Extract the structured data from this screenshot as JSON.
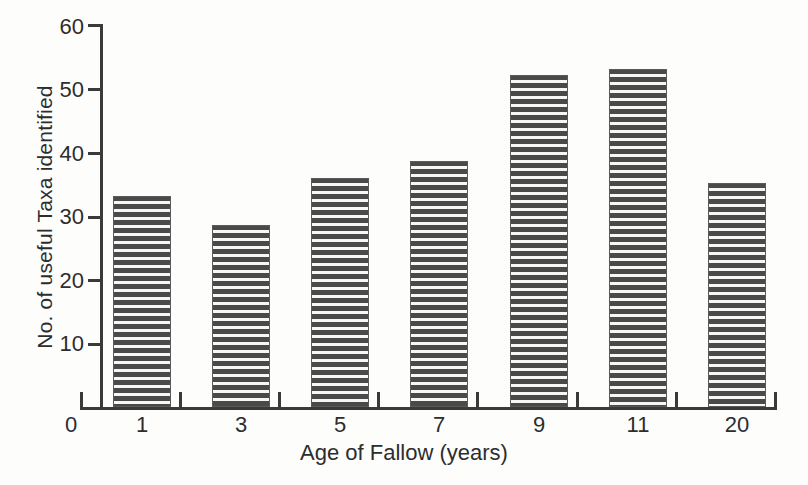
{
  "chart_data": {
    "type": "bar",
    "title": "",
    "xlabel": "Age of Fallow (years)",
    "ylabel": "No. of useful Taxa identified",
    "categories": [
      "1",
      "3",
      "5",
      "7",
      "9",
      "11",
      "20"
    ],
    "values": [
      33.2,
      28.6,
      36.0,
      38.7,
      52.3,
      53.2,
      35.3
    ],
    "ylim": [
      0,
      60
    ],
    "yticks": [
      0,
      10,
      20,
      30,
      40,
      50,
      60
    ],
    "ytick_labels": [
      "0",
      "10",
      "20",
      "30",
      "40",
      "50",
      "60"
    ],
    "xtick_labels": [
      "0",
      "1",
      "3",
      "5",
      "7",
      "9",
      "11",
      "20"
    ],
    "grid": false,
    "legend": false,
    "legend_position": "none",
    "bar_fill": "horizontal-stripes",
    "colors": {
      "bar_dark": "#4a4a4a",
      "bar_light": "#f7f7f5",
      "axis": "#3a3a3a",
      "text": "#2d2d2d",
      "background": "#fdfdfc"
    }
  }
}
